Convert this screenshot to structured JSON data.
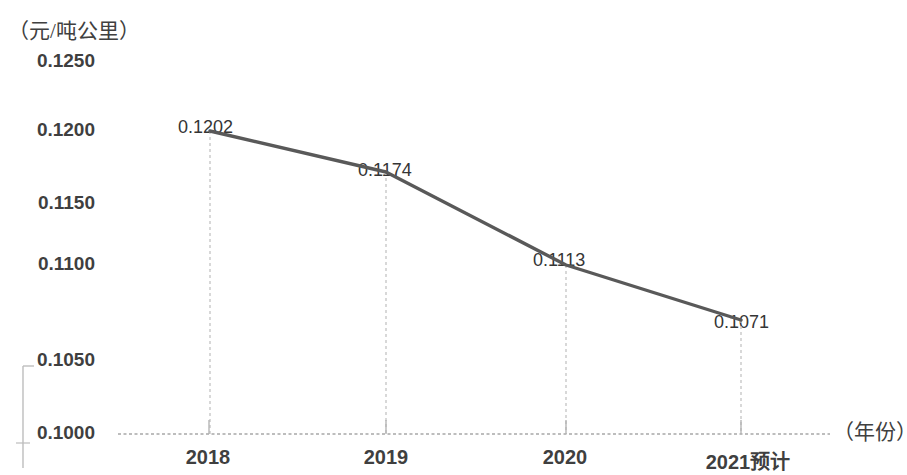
{
  "chart_data": {
    "type": "line",
    "title": "",
    "subtitle": "",
    "xlabel": "（年份）",
    "ylabel": "（元/吨公里）",
    "categories": [
      "2018",
      "2019",
      "2020",
      "2021预计"
    ],
    "values": [
      0.1202,
      0.1174,
      0.1113,
      0.1071
    ],
    "series": [
      {
        "name": "",
        "values": [
          0.1202,
          0.1174,
          0.1113,
          0.1071
        ],
        "color": "#595959"
      }
    ],
    "point_labels": [
      "0.1202",
      "0.1174",
      "0.1113",
      "0.1071"
    ],
    "ylim": [
      0.1,
      0.125
    ],
    "yticks": [
      0.125,
      0.12,
      0.115,
      0.11,
      0.105,
      0.1
    ],
    "ytick_labels": [
      "0.1250",
      "0.1200",
      "0.1150",
      "0.1100",
      "0.1050",
      "0.1000"
    ],
    "xtick_labels": [
      "2018",
      "2019",
      "2020",
      "2021预计"
    ],
    "grid": "vertical-dashed",
    "legend": "none",
    "line_color": "#595959",
    "axis_color": "#a6a6a6",
    "grid_color": "#bfbfbf"
  },
  "axes": {
    "y_unit_label": "（元/吨公里）",
    "x_unit_label": "（年份）"
  },
  "ytick_positions": [
    62,
    131,
    204,
    265,
    361,
    434
  ],
  "xtick_positions": [
    208,
    386,
    565,
    740
  ],
  "point_positions": [
    {
      "x": 210,
      "y": 131
    },
    {
      "x": 386,
      "y": 172
    },
    {
      "x": 566,
      "y": 265
    },
    {
      "x": 741,
      "y": 320
    }
  ],
  "point_label_positions": [
    {
      "x": 178,
      "y": 117
    },
    {
      "x": 358,
      "y": 160
    },
    {
      "x": 533,
      "y": 250
    },
    {
      "x": 714,
      "y": 312
    }
  ]
}
